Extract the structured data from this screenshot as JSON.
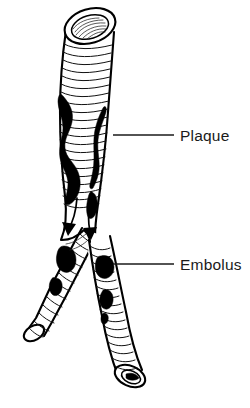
{
  "figure": {
    "background_color": "#ffffff",
    "ink_color": "#000000",
    "width": 250,
    "height": 408
  },
  "labels": [
    {
      "id": "plaque",
      "text": "Plaque",
      "text_x": 180,
      "text_y": 141,
      "leader_x1": 113,
      "leader_y1": 135,
      "leader_x2": 174,
      "leader_y2": 135
    },
    {
      "id": "embolus",
      "text": "Embolus",
      "text_x": 180,
      "text_y": 270,
      "leader_x1": 113,
      "leader_y1": 264,
      "leader_x2": 174,
      "leader_y2": 264
    }
  ],
  "structures": {
    "main_trunk_label": "Main artery trunk",
    "left_branch_label": "Left branch artery",
    "right_branch_label": "Right branch artery",
    "proximal_opening_label": "Proximal lumen opening",
    "distal_opening_label": "Distal lumen opening",
    "plaque_left_label": "Plaque deposit on left wall",
    "plaque_right_label": "Plaque deposit on right wall",
    "embolus_count": 6,
    "flow_arrow_count": 2
  },
  "legend_note": ""
}
